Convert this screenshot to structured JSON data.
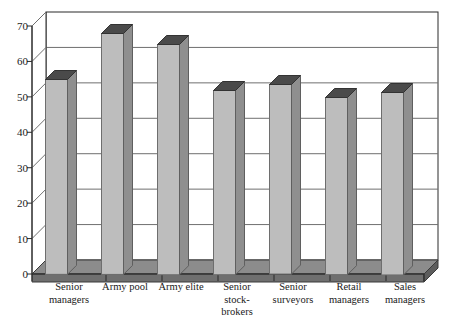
{
  "chart_data": {
    "type": "bar",
    "title": "",
    "subtitle": "",
    "xlabel": "",
    "ylabel": "",
    "categories": [
      "Senior\nmanagers",
      "Army pool",
      "Army elite",
      "Senior\nstock-\nbrokers",
      "Senior\nsurveyors",
      "Retail\nmanagers",
      "Sales\nmanagers"
    ],
    "values": [
      55,
      68,
      65,
      52,
      53.5,
      50,
      51.5
    ],
    "ylim": [
      0,
      70
    ],
    "yticks": [
      0,
      10,
      20,
      30,
      40,
      50,
      60,
      70
    ],
    "ytick_labels": [
      "0",
      "10",
      "20",
      "30",
      "40",
      "50",
      "60",
      "70"
    ],
    "grid": true,
    "legend": false,
    "legend_position": "none",
    "style": "3d-column",
    "colors": {
      "bar_front": "#bdbdbd",
      "bar_side": "#8f8f8f",
      "bar_top": "#4a4a4a",
      "floor": "#7f7f7f",
      "grid": "#6f6f6f",
      "frame": "#2b2b2b",
      "text": "#1a1a1a",
      "background": "#ffffff"
    }
  },
  "axis": {
    "y_tick_labels": [
      "70",
      "60",
      "50",
      "40",
      "30",
      "20",
      "10",
      "0"
    ],
    "x_tick_labels": [
      "Senior\nmanagers",
      "Army pool",
      "Army elite",
      "Senior\nstock-\nbrokers",
      "Senior\nsurveyors",
      "Retail\nmanagers",
      "Sales\nmanagers"
    ]
  }
}
